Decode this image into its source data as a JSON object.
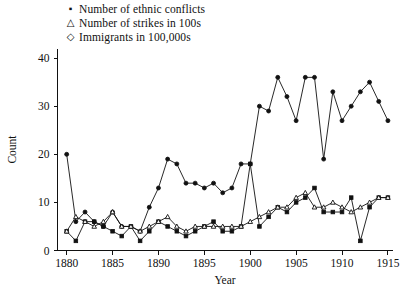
{
  "legend": {
    "items": [
      {
        "marker": "square-marker",
        "glyph": "▪",
        "label": "Number of ethnic conflicts"
      },
      {
        "marker": "triangle-marker",
        "glyph": "△",
        "label": "Number of strikes in 100s"
      },
      {
        "marker": "diamond-marker",
        "glyph": "◇",
        "label": "Immigrants in 100,000s"
      }
    ]
  },
  "chart_data": {
    "type": "line",
    "title": "",
    "xlabel": "Year",
    "ylabel": "Count",
    "xlim": [
      1879,
      1915.5
    ],
    "ylim": [
      0,
      42
    ],
    "xticks": [
      1880,
      1885,
      1890,
      1895,
      1900,
      1905,
      1910,
      1915
    ],
    "yticks": [
      0,
      10,
      20,
      30,
      40
    ],
    "grid": false,
    "legend_position": "top-left",
    "x": [
      1880,
      1881,
      1882,
      1883,
      1884,
      1885,
      1886,
      1887,
      1888,
      1889,
      1890,
      1891,
      1892,
      1893,
      1894,
      1895,
      1896,
      1897,
      1898,
      1899,
      1900,
      1901,
      1902,
      1903,
      1904,
      1905,
      1906,
      1907,
      1908,
      1909,
      1910,
      1911,
      1912,
      1913,
      1914,
      1915
    ],
    "series": [
      {
        "name": "Number of ethnic conflicts",
        "marker": "square",
        "values": [
          4,
          2,
          6,
          6,
          5,
          4,
          3,
          5,
          2,
          4,
          6,
          5,
          4,
          3,
          4,
          5,
          6,
          4,
          4,
          5,
          18,
          5,
          7,
          9,
          8,
          10,
          11,
          13,
          8,
          8,
          8,
          11,
          2,
          9,
          11,
          11
        ]
      },
      {
        "name": "Number of strikes in 100s",
        "marker": "triangle",
        "values": [
          4,
          7,
          6,
          5,
          6,
          8,
          5,
          5,
          4,
          5,
          6,
          7,
          5,
          4,
          5,
          5,
          5,
          5,
          5,
          5,
          6,
          7,
          8,
          9,
          9,
          11,
          12,
          9,
          9,
          10,
          9,
          8,
          9,
          10,
          11,
          11
        ]
      },
      {
        "name": "Immigrants in 100,000s",
        "marker": "diamond",
        "values": [
          20,
          6,
          8,
          6,
          5,
          4,
          4,
          5,
          5,
          4,
          6,
          5,
          5,
          4,
          3,
          3,
          3,
          2,
          3,
          3,
          5,
          8,
          9,
          12,
          13,
          14,
          16,
          17,
          12,
          14,
          16,
          17,
          14,
          16,
          18,
          15
        ]
      }
    ],
    "series_display": {
      "ethnic_conflicts_points": [
        [
          1880,
          4
        ],
        [
          1881,
          2
        ],
        [
          1882,
          6
        ],
        [
          1883,
          6
        ],
        [
          1884,
          5
        ],
        [
          1885,
          4
        ],
        [
          1886,
          3
        ],
        [
          1887,
          5
        ],
        [
          1888,
          2
        ],
        [
          1889,
          4
        ],
        [
          1890,
          6
        ],
        [
          1891,
          5
        ],
        [
          1892,
          4
        ],
        [
          1893,
          3
        ],
        [
          1894,
          4
        ],
        [
          1895,
          5
        ],
        [
          1896,
          6
        ],
        [
          1897,
          4
        ],
        [
          1898,
          4
        ],
        [
          1899,
          5
        ],
        [
          1900,
          18
        ],
        [
          1901,
          5
        ],
        [
          1902,
          7
        ],
        [
          1903,
          9
        ],
        [
          1904,
          8
        ],
        [
          1905,
          10
        ],
        [
          1906,
          11
        ],
        [
          1907,
          13
        ],
        [
          1908,
          8
        ],
        [
          1909,
          8
        ],
        [
          1910,
          8
        ],
        [
          1911,
          11
        ],
        [
          1912,
          2
        ],
        [
          1913,
          9
        ],
        [
          1914,
          11
        ],
        [
          1915,
          11
        ]
      ],
      "strikes_points": [
        [
          1880,
          4
        ],
        [
          1881,
          7
        ],
        [
          1882,
          6
        ],
        [
          1883,
          5
        ],
        [
          1884,
          6
        ],
        [
          1885,
          8
        ],
        [
          1886,
          5
        ],
        [
          1887,
          5
        ],
        [
          1888,
          4
        ],
        [
          1889,
          5
        ],
        [
          1890,
          6
        ],
        [
          1891,
          7
        ],
        [
          1892,
          5
        ],
        [
          1893,
          4
        ],
        [
          1894,
          5
        ],
        [
          1895,
          5
        ],
        [
          1896,
          5
        ],
        [
          1897,
          5
        ],
        [
          1898,
          5
        ],
        [
          1899,
          5
        ],
        [
          1900,
          6
        ],
        [
          1901,
          7
        ],
        [
          1902,
          8
        ],
        [
          1903,
          9
        ],
        [
          1904,
          9
        ],
        [
          1905,
          11
        ],
        [
          1906,
          12
        ],
        [
          1907,
          9
        ],
        [
          1908,
          9
        ],
        [
          1909,
          10
        ],
        [
          1910,
          9
        ],
        [
          1911,
          8
        ],
        [
          1912,
          9
        ],
        [
          1913,
          10
        ],
        [
          1914,
          11
        ],
        [
          1915,
          11
        ]
      ],
      "immigrants_points": [
        [
          1880,
          20
        ],
        [
          1881,
          6
        ],
        [
          1882,
          8
        ],
        [
          1883,
          6
        ],
        [
          1884,
          5
        ],
        [
          1885,
          4
        ],
        [
          1886,
          4
        ],
        [
          1887,
          5
        ],
        [
          1888,
          5
        ],
        [
          1889,
          4
        ],
        [
          1890,
          6
        ],
        [
          1891,
          5
        ],
        [
          1892,
          5
        ],
        [
          1893,
          4
        ],
        [
          1894,
          3
        ],
        [
          1895,
          3
        ],
        [
          1896,
          3
        ],
        [
          1897,
          2
        ],
        [
          1898,
          3
        ],
        [
          1899,
          3
        ],
        [
          1900,
          5
        ],
        [
          1901,
          8
        ],
        [
          1902,
          9
        ],
        [
          1903,
          12
        ],
        [
          1904,
          13
        ],
        [
          1905,
          14
        ],
        [
          1906,
          16
        ],
        [
          1907,
          17
        ],
        [
          1908,
          12
        ],
        [
          1909,
          14
        ],
        [
          1910,
          16
        ],
        [
          1911,
          17
        ],
        [
          1912,
          14
        ],
        [
          1913,
          16
        ],
        [
          1914,
          18
        ],
        [
          1915,
          15
        ]
      ]
    },
    "upper_curve": {
      "name": "Immigrants in 100,000s (upper trace)",
      "points": [
        [
          1880,
          20
        ],
        [
          1881,
          6
        ],
        [
          1882,
          8
        ],
        [
          1883,
          6
        ],
        [
          1884,
          5
        ],
        [
          1885,
          8
        ],
        [
          1886,
          5
        ],
        [
          1887,
          5
        ],
        [
          1888,
          4
        ],
        [
          1889,
          9
        ],
        [
          1890,
          13
        ],
        [
          1891,
          19
        ],
        [
          1892,
          18
        ],
        [
          1893,
          14
        ],
        [
          1894,
          14
        ],
        [
          1895,
          13
        ],
        [
          1896,
          14
        ],
        [
          1897,
          12
        ],
        [
          1898,
          13
        ],
        [
          1899,
          18
        ],
        [
          1900,
          18
        ],
        [
          1901,
          30
        ],
        [
          1902,
          29
        ],
        [
          1903,
          36
        ],
        [
          1904,
          32
        ],
        [
          1905,
          27
        ],
        [
          1906,
          36
        ],
        [
          1907,
          36
        ],
        [
          1908,
          19
        ],
        [
          1909,
          33
        ],
        [
          1910,
          27
        ],
        [
          1911,
          30
        ],
        [
          1912,
          33
        ],
        [
          1913,
          35
        ],
        [
          1914,
          31
        ],
        [
          1915,
          27
        ]
      ]
    }
  }
}
